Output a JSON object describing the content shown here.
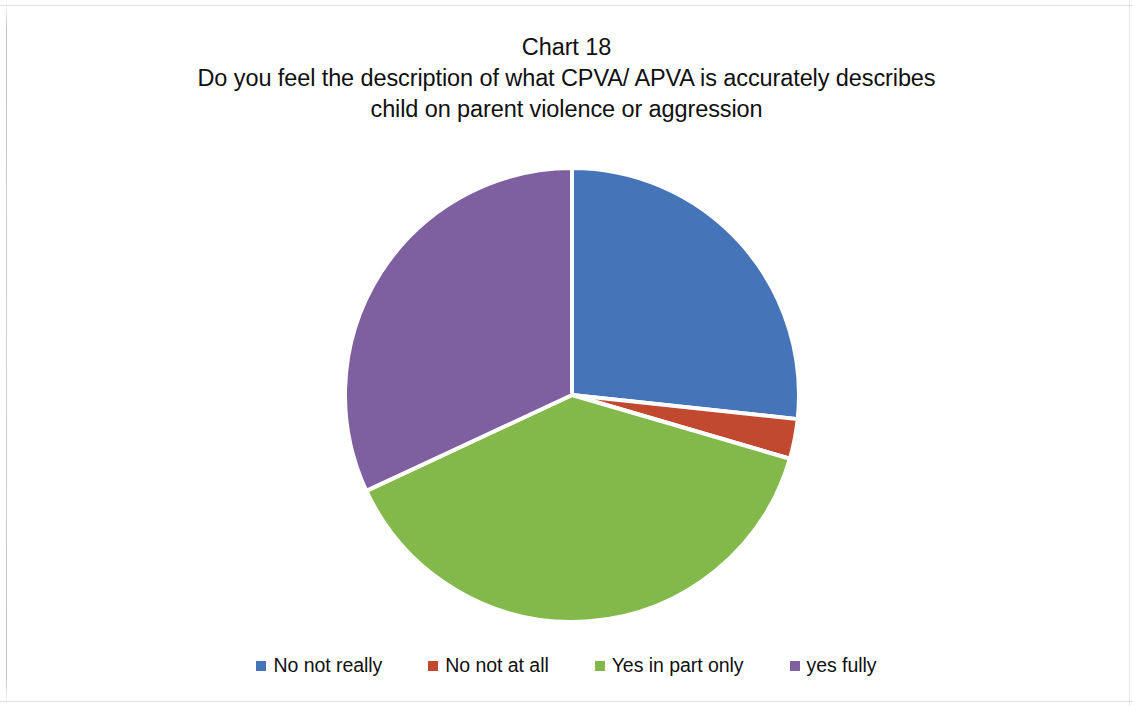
{
  "title": {
    "line1": "Chart 18",
    "line2": "Do you feel the description of what CPVA/ APVA is accurately describes",
    "line3": "child on parent violence or aggression"
  },
  "legend": {
    "position": "bottom",
    "items": [
      {
        "label": "No not really",
        "color": "#4574B8"
      },
      {
        "label": "No not at all",
        "color": "#C0492F"
      },
      {
        "label": "Yes in part only",
        "color": "#82B94A"
      },
      {
        "label": "yes fully",
        "color": "#7E5FA0"
      }
    ]
  },
  "chart_data": {
    "type": "pie",
    "xlabel": "",
    "ylabel": "",
    "grid": false,
    "legend_position": "bottom",
    "start_angle_deg": 0,
    "direction": "clockwise",
    "categories": [
      "No not really",
      "No not at all",
      "Yes in part only",
      "yes fully"
    ],
    "values": [
      26.7,
      2.8,
      38.5,
      32.0
    ],
    "units": "percent",
    "colors": [
      "#4574B8",
      "#C0492F",
      "#82B94A",
      "#7E5FA0"
    ],
    "slices": [
      {
        "label": "No not really",
        "percent": 26.7,
        "sweep_deg": 96.1,
        "start_deg": 0.0,
        "end_deg": 96.1,
        "color": "#4574B8"
      },
      {
        "label": "No not at all",
        "percent": 2.8,
        "sweep_deg": 10.2,
        "start_deg": 96.1,
        "end_deg": 106.3,
        "color": "#C0492F"
      },
      {
        "label": "Yes in part only",
        "percent": 38.5,
        "sweep_deg": 138.7,
        "start_deg": 106.3,
        "end_deg": 245.0,
        "color": "#82B94A"
      },
      {
        "label": "yes fully",
        "percent": 32.0,
        "sweep_deg": 115.0,
        "start_deg": 245.0,
        "end_deg": 360.0,
        "color": "#7E5FA0"
      }
    ],
    "data_labels_shown": false
  },
  "geometry": {
    "center_x": 572,
    "center_y": 245,
    "radius": 227,
    "separator_color": "#ffffff",
    "separator_width": 4
  }
}
